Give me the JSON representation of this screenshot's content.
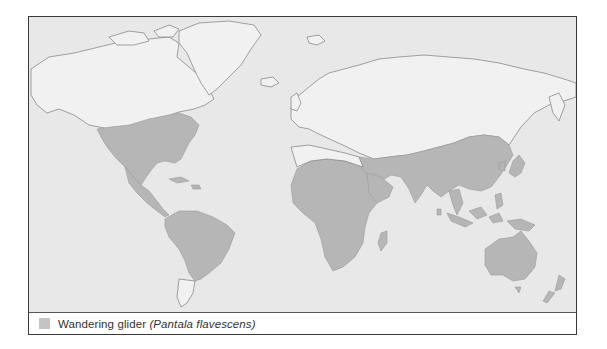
{
  "map": {
    "title": "World distribution map",
    "projection": "world",
    "colors": {
      "ocean": "#e8e8e8",
      "land": "#f1f1f1",
      "coastline": "#8a8a8a",
      "range": "#b6b6b6",
      "frame": "#3a3a3a"
    },
    "range_regions": [
      "North America (southern Canada to southern US)",
      "Central America and Mexico",
      "South America (north and central)",
      "Africa (entire, except far north Mediterranean coast)",
      "Arabian Peninsula and Middle East",
      "South and East Asia (India, China, Southeast Asia)",
      "Japan and Korea",
      "Maritime Southeast Asia and New Guinea",
      "Australia",
      "New Zealand",
      "Madagascar"
    ]
  },
  "legend": {
    "items": [
      {
        "swatch_color": "#c4c4c4",
        "common_name": "Wandering glider",
        "scientific_name": "(Pantala flavescens)"
      }
    ]
  }
}
